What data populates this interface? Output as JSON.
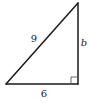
{
  "diagram": {
    "type": "right-triangle",
    "colors": {
      "stroke": "#1a1a1a",
      "right_angle_marker": "#555555",
      "text": "#222222",
      "background": "#ffffff"
    },
    "vertices": {
      "top": [
        78,
        3
      ],
      "bottom_left": [
        6,
        84
      ],
      "bottom_right": [
        78,
        84
      ]
    },
    "labels": {
      "hypotenuse": "9",
      "vertical_leg": "b",
      "horizontal_leg": "6"
    },
    "right_angle_at": "bottom_right"
  }
}
